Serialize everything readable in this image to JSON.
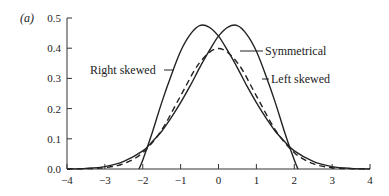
{
  "panel_label": "(a)",
  "chart_data": {
    "type": "line",
    "title": "",
    "xlabel": "",
    "ylabel": "",
    "xlim": [
      -4,
      4
    ],
    "ylim": [
      0,
      0.5
    ],
    "xticks": [
      -4,
      -3,
      -2,
      -1,
      0,
      1,
      2,
      3,
      4
    ],
    "xtick_labels": [
      "−4",
      "−3",
      "−2",
      "−1",
      "0",
      "1",
      "2",
      "3",
      "4"
    ],
    "yticks": [
      0.0,
      0.1,
      0.2,
      0.3,
      0.4,
      0.5
    ],
    "ytick_labels": [
      "0.0",
      "0.1",
      "0.2",
      "0.3",
      "0.4",
      "0.5"
    ],
    "grid": false,
    "legend": "none (inline annotations)",
    "series": [
      {
        "name": "Symmetrical",
        "style": "dashed",
        "x": [
          -4,
          -3.5,
          -3,
          -2.5,
          -2,
          -1.5,
          -1,
          -0.5,
          0,
          0.5,
          1,
          1.5,
          2,
          2.5,
          3,
          3.5,
          4
        ],
        "y": [
          0.0001,
          0.0009,
          0.0044,
          0.0175,
          0.054,
          0.1295,
          0.242,
          0.352,
          0.399,
          0.352,
          0.242,
          0.1295,
          0.054,
          0.0175,
          0.0044,
          0.0009,
          0.0001
        ]
      },
      {
        "name": "Right skewed",
        "style": "solid",
        "x": [
          -2.1,
          -2.0,
          -1.75,
          -1.5,
          -1.25,
          -1,
          -0.75,
          -0.5,
          -0.25,
          0,
          0.25,
          0.5,
          0.75,
          1,
          1.25,
          1.5,
          1.75,
          2,
          2.5,
          3,
          3.5,
          4
        ],
        "y": [
          0.0,
          0.03,
          0.12,
          0.22,
          0.31,
          0.39,
          0.445,
          0.475,
          0.47,
          0.44,
          0.39,
          0.335,
          0.275,
          0.22,
          0.17,
          0.125,
          0.09,
          0.06,
          0.025,
          0.008,
          0.002,
          0.0
        ]
      },
      {
        "name": "Left skewed",
        "style": "solid",
        "x": [
          -4,
          -3.5,
          -3,
          -2.5,
          -2,
          -1.75,
          -1.5,
          -1.25,
          -1,
          -0.75,
          -0.5,
          -0.25,
          0,
          0.25,
          0.5,
          0.75,
          1,
          1.25,
          1.5,
          1.75,
          2,
          2.1
        ],
        "y": [
          0.0,
          0.002,
          0.008,
          0.025,
          0.06,
          0.09,
          0.125,
          0.17,
          0.22,
          0.275,
          0.335,
          0.39,
          0.44,
          0.47,
          0.475,
          0.445,
          0.39,
          0.31,
          0.22,
          0.12,
          0.03,
          0.0
        ]
      }
    ],
    "annotations": [
      {
        "text": "Right skewed",
        "target_series": "Right skewed"
      },
      {
        "text": "Symmetrical",
        "target_series": "Symmetrical"
      },
      {
        "text": "Left skewed",
        "target_series": "Left skewed"
      }
    ]
  }
}
